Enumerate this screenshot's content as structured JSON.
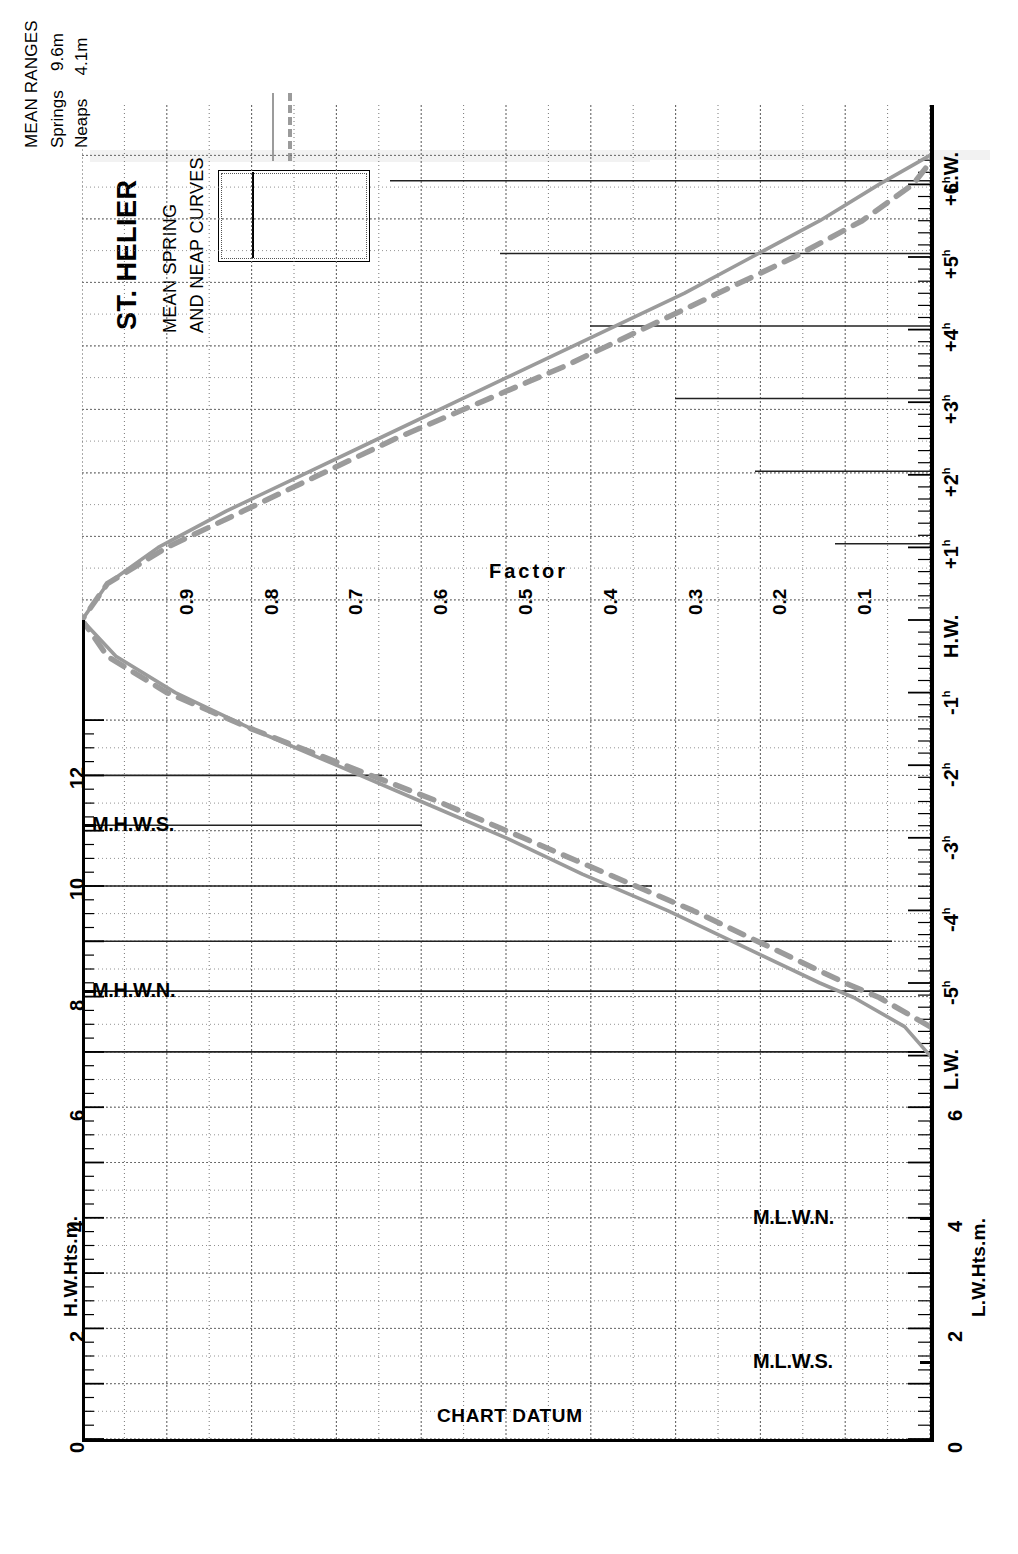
{
  "title": {
    "port": "ST. HELIER",
    "line1": "MEAN SPRING",
    "line2": "AND NEAP CURVES"
  },
  "legend": {
    "heading": "MEAN RANGES",
    "rows": [
      {
        "label": "Springs",
        "value": "9.6m",
        "style": "solid"
      },
      {
        "label": "Neaps",
        "value": "4.1m",
        "style": "dashed"
      }
    ]
  },
  "axes": {
    "factor_word": "Factor",
    "factor_ticks": [
      "0.9",
      "0.8",
      "0.7",
      "0.6",
      "0.5",
      "0.4",
      "0.3",
      "0.2",
      "0.1"
    ],
    "time_top": [
      "L.W.",
      "+6",
      "+5",
      "+4",
      "+3",
      "+2",
      "+1",
      "H.W."
    ],
    "time_bottom": [
      "H.W.",
      "-1",
      "-2",
      "-3",
      "-4",
      "-5",
      "L.W."
    ],
    "hour_superscript": "h",
    "left_axis_name": "H.W.Hts.m.",
    "right_axis_name": "L.W.Hts.m.",
    "left_ticks": [
      "12",
      "10",
      "8",
      "6",
      "4",
      "2",
      "0"
    ],
    "right_ticks": [
      "6",
      "4",
      "2",
      "0"
    ],
    "datum_label": "CHART DATUM"
  },
  "levels": {
    "mhws": "M.H.W.S.",
    "mhwn": "M.H.W.N.",
    "mlwn": "M.L.W.N.",
    "mlws": "M.L.W.S."
  },
  "chart_data": {
    "type": "line",
    "xlabel": "Factor",
    "ylabel": "Time relative to High Water (hours)",
    "orientation": "rotated-90",
    "grid": true,
    "legend_position": "top-left",
    "xlim": [
      0.0,
      1.0
    ],
    "ylim": [
      -6.0,
      6.5
    ],
    "height_scale_hw": {
      "label": "H.W.Hts.m.",
      "min": 0,
      "max": 13,
      "ticks": [
        0,
        2,
        4,
        6,
        8,
        10,
        12
      ]
    },
    "height_scale_lw": {
      "label": "L.W.Hts.m.",
      "min": 0,
      "max": 7,
      "ticks": [
        0,
        2,
        4,
        6
      ]
    },
    "reference_levels": [
      {
        "name": "M.H.W.S.",
        "scale": "H.W.Hts.m.",
        "value": 11.1
      },
      {
        "name": "M.H.W.N.",
        "scale": "H.W.Hts.m.",
        "value": 8.1
      },
      {
        "name": "M.L.W.N.",
        "scale": "L.W.Hts.m.",
        "value": 4.0
      },
      {
        "name": "M.L.W.S.",
        "scale": "L.W.Hts.m.",
        "value": 1.4
      }
    ],
    "mean_ranges": {
      "springs_m": 9.6,
      "neaps_m": 4.1
    },
    "series": [
      {
        "name": "Springs",
        "style": "solid",
        "color": "#9b9b9b",
        "points": [
          {
            "hours": -6.0,
            "factor": 0.0
          },
          {
            "hours": -5.6,
            "factor": 0.03
          },
          {
            "hours": -5.2,
            "factor": 0.09
          },
          {
            "hours": -5.0,
            "factor": 0.13
          },
          {
            "hours": -4.5,
            "factor": 0.22
          },
          {
            "hours": -4.0,
            "factor": 0.31
          },
          {
            "hours": -3.5,
            "factor": 0.41
          },
          {
            "hours": -3.0,
            "factor": 0.5
          },
          {
            "hours": -2.5,
            "factor": 0.6
          },
          {
            "hours": -2.0,
            "factor": 0.7
          },
          {
            "hours": -1.5,
            "factor": 0.8
          },
          {
            "hours": -1.0,
            "factor": 0.89
          },
          {
            "hours": -0.5,
            "factor": 0.96
          },
          {
            "hours": 0.0,
            "factor": 1.0
          },
          {
            "hours": 0.5,
            "factor": 0.97
          },
          {
            "hours": 1.0,
            "factor": 0.91
          },
          {
            "hours": 1.5,
            "factor": 0.83
          },
          {
            "hours": 2.0,
            "factor": 0.74
          },
          {
            "hours": 2.5,
            "factor": 0.65
          },
          {
            "hours": 3.0,
            "factor": 0.56
          },
          {
            "hours": 3.5,
            "factor": 0.47
          },
          {
            "hours": 4.0,
            "factor": 0.38
          },
          {
            "hours": 4.5,
            "factor": 0.29
          },
          {
            "hours": 5.0,
            "factor": 0.21
          },
          {
            "hours": 5.5,
            "factor": 0.13
          },
          {
            "hours": 6.0,
            "factor": 0.06
          },
          {
            "hours": 6.4,
            "factor": 0.0
          }
        ]
      },
      {
        "name": "Neaps",
        "style": "dashed",
        "color": "#9b9b9b",
        "points": [
          {
            "hours": -5.6,
            "factor": 0.0
          },
          {
            "hours": -5.2,
            "factor": 0.06
          },
          {
            "hours": -5.0,
            "factor": 0.1
          },
          {
            "hours": -4.5,
            "factor": 0.19
          },
          {
            "hours": -4.0,
            "factor": 0.28
          },
          {
            "hours": -3.5,
            "factor": 0.38
          },
          {
            "hours": -3.0,
            "factor": 0.48
          },
          {
            "hours": -2.5,
            "factor": 0.58
          },
          {
            "hours": -2.0,
            "factor": 0.69
          },
          {
            "hours": -1.5,
            "factor": 0.8
          },
          {
            "hours": -1.0,
            "factor": 0.9
          },
          {
            "hours": -0.5,
            "factor": 0.97
          },
          {
            "hours": 0.0,
            "factor": 1.0
          },
          {
            "hours": 0.5,
            "factor": 0.97
          },
          {
            "hours": 1.0,
            "factor": 0.9
          },
          {
            "hours": 1.5,
            "factor": 0.81
          },
          {
            "hours": 2.0,
            "factor": 0.72
          },
          {
            "hours": 2.5,
            "factor": 0.63
          },
          {
            "hours": 3.0,
            "factor": 0.53
          },
          {
            "hours": 3.5,
            "factor": 0.43
          },
          {
            "hours": 4.0,
            "factor": 0.34
          },
          {
            "hours": 4.5,
            "factor": 0.25
          },
          {
            "hours": 5.0,
            "factor": 0.16
          },
          {
            "hours": 5.5,
            "factor": 0.08
          },
          {
            "hours": 6.0,
            "factor": 0.02
          },
          {
            "hours": 6.3,
            "factor": 0.0
          }
        ]
      }
    ]
  }
}
